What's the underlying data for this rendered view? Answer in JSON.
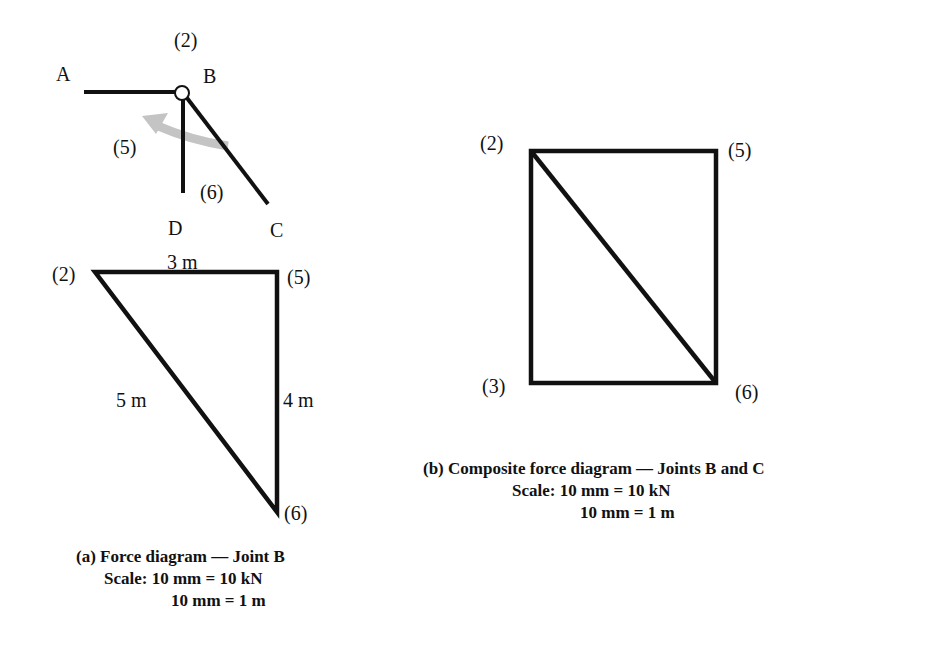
{
  "truss": {
    "joints": {
      "A": "A",
      "B": "B",
      "C": "C",
      "D": "D"
    },
    "members": {
      "top": "(2)",
      "left": "(5)",
      "right": "(6)"
    }
  },
  "diagram_a": {
    "nodes": {
      "n2": "(2)",
      "n5": "(5)",
      "n6": "(6)"
    },
    "edges": {
      "top": "3 m",
      "hyp": "5 m",
      "right": "4 m"
    },
    "caption": {
      "title": "(a) Force diagram — Joint B",
      "scale1": "Scale: 10 mm = 10 kN",
      "scale2": "10 mm = 1 m"
    }
  },
  "diagram_b": {
    "nodes": {
      "n2": "(2)",
      "n5": "(5)",
      "n3": "(3)",
      "n6": "(6)"
    },
    "caption": {
      "title": "(b) Composite force diagram — Joints B and C",
      "scale1": "Scale: 10 mm = 10 kN",
      "scale2": "10 mm = 1 m"
    }
  },
  "colors": {
    "line": "#111111",
    "arrow": "#bdbdbd"
  }
}
